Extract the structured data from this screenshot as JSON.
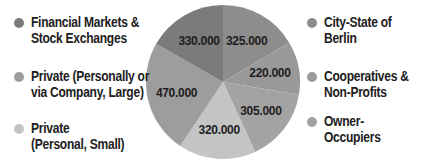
{
  "chart_data": {
    "type": "pie",
    "title": "",
    "start_angle_deg": 0,
    "direction": "clockwise",
    "slices": [
      {
        "label": "City-State of Berlin",
        "value": 325000,
        "display": "325.000",
        "color": "#8d8d8d"
      },
      {
        "label": "Cooperatives & Non-Profits",
        "value": 220000,
        "display": "220.000",
        "color": "#999999"
      },
      {
        "label": "Owner-Occupiers",
        "value": 305000,
        "display": "305.000",
        "color": "#a3a3a3"
      },
      {
        "label": "Private (Personal, Small)",
        "value": 320000,
        "display": "320.000",
        "color": "#c4c4c4"
      },
      {
        "label": "Private (Personally or via Company, Large)",
        "value": 470000,
        "display": "470.000",
        "color": "#9d9d9d"
      },
      {
        "label": "Financial Markets & Stock Exchanges",
        "value": 330000,
        "display": "330.000",
        "color": "#7b7b7b"
      }
    ],
    "legend_position": "left and right"
  },
  "legend": {
    "left": [
      {
        "label": "Financial Markets &\nStock Exchanges",
        "color": "#7b7b7b"
      },
      {
        "label": "Private (Personally or\nvia Company, Large)",
        "color": "#9d9d9d"
      },
      {
        "label": "Private\n(Personal, Small)",
        "color": "#c4c4c4"
      }
    ],
    "right": [
      {
        "label": "City-State of Berlin",
        "color": "#8d8d8d"
      },
      {
        "label": "Cooperatives &\nNon-Profits",
        "color": "#999999"
      },
      {
        "label": "Owner-Occupiers",
        "color": "#a3a3a3"
      }
    ]
  }
}
